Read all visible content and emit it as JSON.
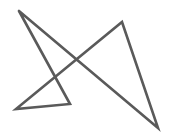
{
  "figure": {
    "width": 173,
    "height": 137,
    "background": "#ffffff",
    "stroke_color": "#5a5a5a",
    "stroke_width": 2.6,
    "shape": "closed-self-intersecting-polyline",
    "vertices": [
      {
        "name": "top-left",
        "x": 19,
        "y": 11
      },
      {
        "name": "bottom-right",
        "x": 158,
        "y": 128
      },
      {
        "name": "top-right",
        "x": 122,
        "y": 22
      },
      {
        "name": "bottom-left",
        "x": 16,
        "y": 109
      },
      {
        "name": "inner-bottom",
        "x": 70,
        "y": 104
      },
      {
        "name": "top-left-close",
        "x": 19,
        "y": 11
      }
    ]
  }
}
